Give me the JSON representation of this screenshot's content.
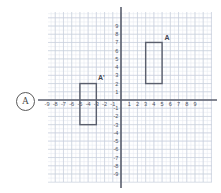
{
  "problem": {
    "marker_label": "A"
  },
  "chart_data": {
    "type": "scatter",
    "title": "",
    "xlabel": "",
    "ylabel": "",
    "xlim": [
      -10,
      11
    ],
    "ylim": [
      -10.5,
      10.5
    ],
    "grid": true,
    "legend": false,
    "axis_color": "#5b5f6e",
    "grid_color": "#c9d0dc",
    "minor_grid_color": "#e2e7ef",
    "shape_color": "#5a5f6d",
    "x_tick_labels": [
      "-9",
      "-8",
      "-7",
      "-6",
      "-5",
      "-4",
      "-3",
      "-2",
      "-1",
      "1",
      "2",
      "3",
      "4",
      "5",
      "6",
      "7",
      "8",
      "9"
    ],
    "x_tick_values": [
      -9,
      -8,
      -7,
      -6,
      -5,
      -4,
      -3,
      -2,
      -1,
      1,
      2,
      3,
      4,
      5,
      6,
      7,
      8,
      9
    ],
    "y_tick_labels": [
      "9",
      "8",
      "7",
      "6",
      "5",
      "4",
      "3",
      "2",
      "1",
      "-1",
      "-2",
      "-3",
      "-4",
      "-5",
      "-6",
      "-7",
      "-8",
      "-9"
    ],
    "y_tick_values": [
      9,
      8,
      7,
      6,
      5,
      4,
      3,
      2,
      1,
      -1,
      -2,
      -3,
      -4,
      -5,
      -6,
      -7,
      -8,
      -9
    ],
    "shapes": [
      {
        "name": "rectangle-a",
        "label": "A",
        "label_x": 5.6,
        "label_y": 7.6,
        "x0": 3,
        "y0": 2,
        "x1": 5,
        "y1": 7
      },
      {
        "name": "rectangle-a-prime",
        "label": "A'",
        "label_x": -2.4,
        "label_y": 2.7,
        "x0": -5,
        "y0": -3,
        "x1": -3,
        "y1": 2
      }
    ]
  }
}
